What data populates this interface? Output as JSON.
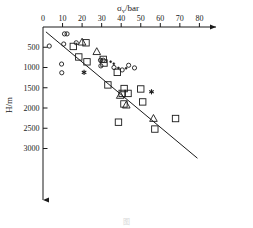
{
  "chart_data": {
    "type": "scatter",
    "title": "",
    "xlabel": "σv/bar",
    "xlabel_base": "σ",
    "xlabel_sub": "v",
    "xlabel_unit": "/bar",
    "ylabel": "H/m",
    "xlim": [
      0,
      88
    ],
    "ylim": [
      0,
      3500
    ],
    "y_inverted": true,
    "grid": false,
    "legend": "none",
    "x_ticks": [
      0,
      10,
      20,
      30,
      40,
      50,
      60,
      70,
      80
    ],
    "x_tick_labels": [
      "0",
      "10",
      "20",
      "30",
      "40",
      "50",
      "60",
      "70",
      "80"
    ],
    "y_ticks": [
      500,
      1000,
      1500,
      2000,
      2500,
      3000
    ],
    "y_tick_labels": [
      "500",
      "1000",
      "1500",
      "2000",
      "2500",
      "3000"
    ],
    "x_axis_position": "top",
    "y_axis_position": "left",
    "x_axis_arrow": true,
    "y_axis_arrow": true,
    "trend_line": {
      "x_start": 1.5,
      "y_start": 120,
      "x_end": 79.0,
      "y_end": 3240
    },
    "series": [
      {
        "name": "open-circle",
        "marker": "circle-open",
        "size": 4.2,
        "points": [
          [
            3.2,
            470
          ],
          [
            11.0,
            170
          ],
          [
            12.3,
            170
          ],
          [
            10.6,
            420
          ],
          [
            9.5,
            915
          ],
          [
            9.6,
            1130
          ],
          [
            17.0,
            390
          ],
          [
            29.4,
            820
          ],
          [
            30.8,
            820
          ],
          [
            29.6,
            960
          ],
          [
            36.3,
            1000
          ],
          [
            40.5,
            1060
          ],
          [
            43.8,
            945
          ],
          [
            46.8,
            1010
          ]
        ]
      },
      {
        "name": "filled-dot",
        "marker": "circle-filled",
        "size": 2.0,
        "points": [
          [
            34.6,
            855
          ],
          [
            36.2,
            905
          ],
          [
            38.6,
            1010
          ],
          [
            42.5,
            1020
          ]
        ]
      },
      {
        "name": "open-square",
        "marker": "square-open",
        "size": 6.4,
        "points": [
          [
            15.5,
            480
          ],
          [
            22.0,
            390
          ],
          [
            18.3,
            740
          ],
          [
            22.5,
            860
          ],
          [
            30.8,
            800
          ],
          [
            31.2,
            890
          ],
          [
            33.2,
            1430
          ],
          [
            38.0,
            1120
          ],
          [
            40.5,
            1640
          ],
          [
            41.5,
            1520
          ],
          [
            41.4,
            1900
          ],
          [
            43.5,
            1640
          ],
          [
            50.0,
            1530
          ],
          [
            51.0,
            1850
          ],
          [
            38.6,
            2350
          ],
          [
            57.2,
            2520
          ],
          [
            67.8,
            2260
          ]
        ]
      },
      {
        "name": "open-triangle",
        "marker": "triangle-open",
        "size": 7.6,
        "points": [
          [
            20.0,
            375
          ],
          [
            27.5,
            610
          ],
          [
            39.5,
            1690
          ],
          [
            42.6,
            1930
          ],
          [
            56.5,
            2260
          ]
        ]
      },
      {
        "name": "asterisk",
        "marker": "asterisk",
        "size": 5.2,
        "points": [
          [
            21.0,
            1120
          ],
          [
            55.5,
            1600
          ]
        ]
      }
    ]
  },
  "caption": {
    "text": "图"
  }
}
